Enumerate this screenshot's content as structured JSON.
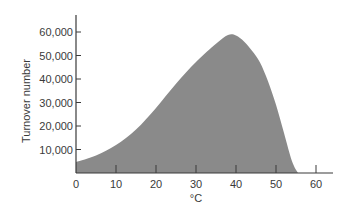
{
  "chart_data": {
    "type": "area",
    "title": "",
    "xlabel": "°C",
    "ylabel": "Turnover number",
    "xlim": [
      0,
      64
    ],
    "ylim": [
      0,
      65000
    ],
    "xticks": [
      0,
      10,
      20,
      30,
      40,
      50,
      60
    ],
    "xtick_labels": [
      "0",
      "10",
      "20",
      "30",
      "40",
      "50",
      "60"
    ],
    "yticks": [
      10000,
      20000,
      30000,
      40000,
      50000,
      60000
    ],
    "ytick_labels": [
      "10,000",
      "20,000",
      "30,000",
      "40,000",
      "50,000",
      "60,000"
    ],
    "grid": false,
    "legend": null,
    "fill_color": "#8a8a8a",
    "axis_color": "#3a3a3a",
    "series": [
      {
        "name": "Turnover number vs temperature",
        "x": [
          0,
          5,
          10,
          15,
          20,
          25,
          30,
          35,
          38,
          40,
          42,
          44,
          46,
          48,
          50,
          52,
          54,
          55.5
        ],
        "values": [
          4700,
          7500,
          11900,
          18500,
          27700,
          38000,
          47200,
          55000,
          58700,
          58500,
          56000,
          52000,
          47000,
          39000,
          29000,
          17000,
          5000,
          0
        ]
      }
    ]
  }
}
